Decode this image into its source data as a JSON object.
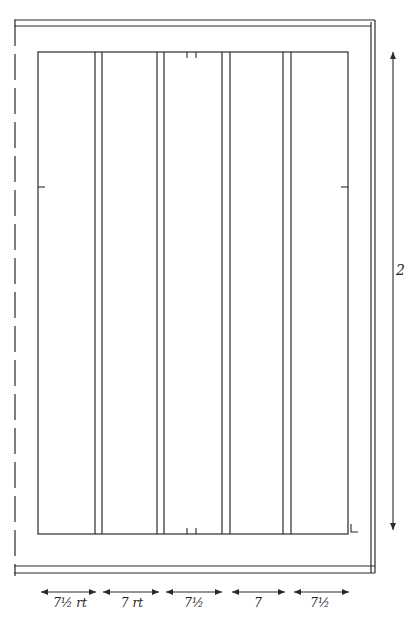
{
  "diagram": {
    "type": "panel-layout-sketch",
    "stroke_color": "#2a2a2a",
    "background": "#ffffff",
    "outer_frame": {
      "left": 14,
      "top": 20,
      "right": 375,
      "bottom": 573,
      "left_edge_style": "dashed"
    },
    "inner_panel": {
      "left": 38,
      "top": 52,
      "right": 348,
      "bottom": 534
    },
    "divider_pairs": [
      {
        "x1": 95,
        "x2": 102
      },
      {
        "x1": 157,
        "x2": 164
      },
      {
        "x1": 222,
        "x2": 230
      },
      {
        "x1": 283,
        "x2": 291
      }
    ],
    "height_dimension": {
      "label": "2",
      "x": 393,
      "y_top": 50,
      "y_bottom": 532
    },
    "width_dimensions": [
      {
        "label": "7½ rt",
        "x_start": 40,
        "x_end": 97
      },
      {
        "label": "7 rt",
        "x_start": 103,
        "x_end": 159
      },
      {
        "label": "7½",
        "x_start": 166,
        "x_end": 222
      },
      {
        "label": "7",
        "x_start": 231,
        "x_end": 285
      },
      {
        "label": "7½",
        "x_start": 293,
        "x_end": 349
      }
    ],
    "marks": {
      "top_center_ticks": [
        187,
        196
      ],
      "bottom_center_ticks": [
        187,
        196
      ],
      "side_ticks_y": 187,
      "corner_mark": "L"
    }
  }
}
